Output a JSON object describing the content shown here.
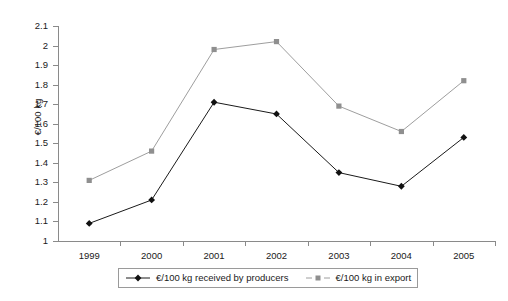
{
  "chart_data": {
    "type": "line",
    "title": "",
    "xlabel": "",
    "ylabel": "€/100 kg",
    "categories": [
      "1999",
      "2000",
      "2001",
      "2002",
      "2003",
      "2004",
      "2005"
    ],
    "ylim": [
      1,
      2.1
    ],
    "ytick_labels": [
      "2.1",
      "2",
      "1.9",
      "1.8",
      "1.7",
      "1.6",
      "1.5",
      "1.4",
      "1.3",
      "1.2",
      "1.1",
      "1"
    ],
    "ytick_values": [
      2.1,
      2,
      1.9,
      1.8,
      1.7,
      1.6,
      1.5,
      1.4,
      1.3,
      1.2,
      1.1,
      1
    ],
    "grid": false,
    "legend_position": "bottom",
    "series": [
      {
        "name": "€/100 kg received by producers",
        "color": "#1a1a1a",
        "marker": "diamond",
        "values": [
          1.09,
          1.21,
          1.71,
          1.65,
          1.35,
          1.28,
          1.53
        ]
      },
      {
        "name": "€/100 kg in export",
        "color": "#9e9e9e",
        "marker": "square",
        "values": [
          1.31,
          1.46,
          1.98,
          2.02,
          1.69,
          1.56,
          1.82
        ]
      }
    ]
  },
  "legend": {
    "entries": [
      {
        "label": "€/100 kg received by producers"
      },
      {
        "label": "€/100 kg in export"
      }
    ]
  }
}
